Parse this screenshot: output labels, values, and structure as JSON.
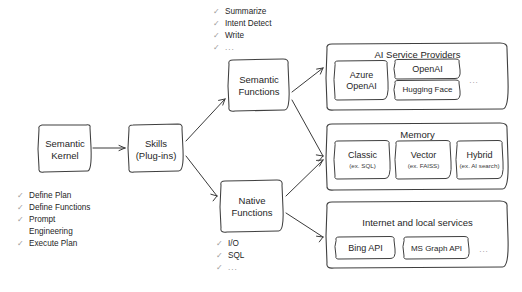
{
  "diagram": {
    "core": {
      "kernel_label": "Semantic\nKernel",
      "skills_label": "Skills\n(Plug-ins)"
    },
    "mid": {
      "semantic_functions_label": "Semantic\nFunctions",
      "native_functions_label": "Native\nFunctions"
    },
    "checklists": {
      "semantic_examples": {
        "items": [
          {
            "tick": "✓",
            "text": "Summarize"
          },
          {
            "tick": "✓",
            "text": "Intent Detect"
          },
          {
            "tick": "✓",
            "text": "Write"
          },
          {
            "tick": "✓",
            "text": "..."
          }
        ]
      },
      "native_examples": {
        "items": [
          {
            "tick": "✓",
            "text": "I/O"
          },
          {
            "tick": "✓",
            "text": "SQL"
          },
          {
            "tick": "✓",
            "text": "..."
          }
        ]
      },
      "kernel_capabilities": {
        "items": [
          {
            "tick": "✓",
            "text": "Define Plan"
          },
          {
            "tick": "✓",
            "text": "Define Functions"
          },
          {
            "tick": "✓",
            "text": "Prompt"
          },
          {
            "tick": "",
            "text": "Engineering"
          },
          {
            "tick": "✓",
            "text": "Execute Plan"
          }
        ]
      }
    },
    "panels": [
      {
        "id": "ai-service-providers",
        "title": "AI Service Providers",
        "items": [
          {
            "label": "Azure\nOpenAI"
          },
          {
            "label": "OpenAI"
          },
          {
            "label": "Hugging Face"
          }
        ],
        "ellipsis": "..."
      },
      {
        "id": "memory",
        "title": "Memory",
        "items": [
          {
            "label": "Classic",
            "sub": "(ex. SQL)"
          },
          {
            "label": "Vector",
            "sub": "(ex. FAISS)"
          },
          {
            "label": "Hybrid",
            "sub": "(ex. AI search)"
          }
        ],
        "ellipsis": ""
      },
      {
        "id": "internet-and-local-services",
        "title": "Internet and local services",
        "items": [
          {
            "label": "Bing API"
          },
          {
            "label": "MS Graph API"
          }
        ],
        "ellipsis": "..."
      }
    ],
    "colors": {
      "background": "#ffffff",
      "stroke": "#3f3f3f",
      "text": "#262626",
      "muted": "#9a9a9a"
    }
  }
}
